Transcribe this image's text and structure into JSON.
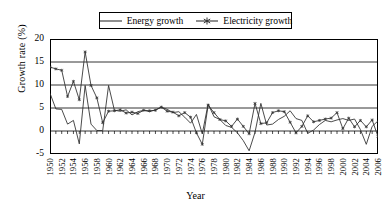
{
  "chart_data": {
    "type": "line",
    "title": "",
    "xlabel": "Year",
    "ylabel": "Growth rate (%)",
    "ylim": [
      -5,
      20
    ],
    "ytick_values": [
      20,
      15,
      10,
      5,
      0,
      -5
    ],
    "ytick_labels": [
      "20",
      "15",
      "10",
      "5",
      "0",
      "-5"
    ],
    "xlim": [
      1950,
      2006
    ],
    "xtick_labels": [
      "1950",
      "1952",
      "1954",
      "1956",
      "1958",
      "1960",
      "1962",
      "1964",
      "1966",
      "1968",
      "1970",
      "1972",
      "1974",
      "1976",
      "1978",
      "1980",
      "1982",
      "1984",
      "1986",
      "1988",
      "1990",
      "1992",
      "1994",
      "1996",
      "1998",
      "2000",
      "2002",
      "2004",
      "2006"
    ],
    "grid": "horizontal",
    "legend_position": "top-center",
    "x": [
      1950,
      1951,
      1952,
      1953,
      1954,
      1955,
      1956,
      1957,
      1958,
      1959,
      1960,
      1961,
      1962,
      1963,
      1964,
      1965,
      1966,
      1967,
      1968,
      1969,
      1970,
      1971,
      1972,
      1973,
      1974,
      1975,
      1976,
      1977,
      1978,
      1979,
      1980,
      1981,
      1982,
      1983,
      1984,
      1985,
      1986,
      1987,
      1988,
      1989,
      1990,
      1991,
      1992,
      1993,
      1994,
      1995,
      1996,
      1997,
      1998,
      1999,
      2000,
      2001,
      2002,
      2003,
      2004,
      2005,
      2006
    ],
    "series": [
      {
        "name": "Energy growth",
        "marker": "none",
        "values": [
          8.2,
          4.8,
          4.7,
          1.5,
          2.3,
          -2.8,
          9.9,
          1.5,
          0.1,
          0.1,
          9.9,
          4.5,
          4.3,
          4.6,
          3.5,
          4.2,
          4.5,
          4.2,
          4.6,
          5.2,
          4.7,
          4.0,
          4.2,
          3.0,
          1.7,
          3.6,
          -0.6,
          5.9,
          3.1,
          2.5,
          1.2,
          0.8,
          -0.4,
          -2.1,
          -4.3,
          -0.3,
          6.0,
          1.3,
          1.5,
          2.5,
          3.2,
          4.4,
          2.7,
          2.3,
          -0.5,
          0.2,
          1.4,
          2.3,
          2.0,
          2.4,
          2.7,
          2.3,
          2.6,
          0.3,
          -2.9,
          1.0,
          2.2
        ]
      },
      {
        "name": "Electricity growth",
        "marker": "star",
        "values": [
          13.9,
          13.5,
          13.2,
          7.5,
          10.8,
          6.8,
          17.2,
          9.9,
          7.2,
          1.8,
          4.3,
          4.4,
          4.6,
          3.9,
          4.1,
          3.8,
          4.5,
          4.4,
          4.5,
          5.2,
          4.3,
          4.1,
          3.3,
          4.0,
          3.0,
          -0.4,
          -2.9,
          5.6,
          4.0,
          2.5,
          2.2,
          1.0,
          2.6,
          1.0,
          -0.6,
          6.0,
          1.6,
          1.8,
          4.0,
          4.4,
          4.2,
          1.9,
          -0.4,
          1.0,
          3.3,
          2.0,
          2.3,
          2.6,
          2.8,
          4.0,
          0.5,
          2.8,
          0.9,
          2.3,
          0.9,
          2.4,
          -1.2
        ]
      }
    ],
    "legend": [
      {
        "label": "Energy growth",
        "style": "line"
      },
      {
        "label": "Electricity growth",
        "style": "line-with-star-marker"
      }
    ]
  }
}
